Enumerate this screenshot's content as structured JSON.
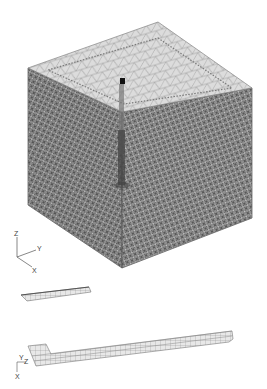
{
  "figure": {
    "main_view": {
      "name": "cube-lattice-mesh",
      "axes": {
        "z": "Z",
        "y": "Y",
        "x": "X"
      }
    },
    "detail_1": {
      "name": "short-beam-mesh"
    },
    "detail_2": {
      "name": "long-beam-mesh",
      "axes": {
        "y": "Y",
        "z": "Z",
        "x": "X"
      }
    }
  },
  "colors": {
    "mesh_line": "#6a6a6a",
    "mesh_dark": "#555555",
    "top_face": "#d8d8d8",
    "background": "#ffffff",
    "element_fill": "#e6e6e6"
  }
}
